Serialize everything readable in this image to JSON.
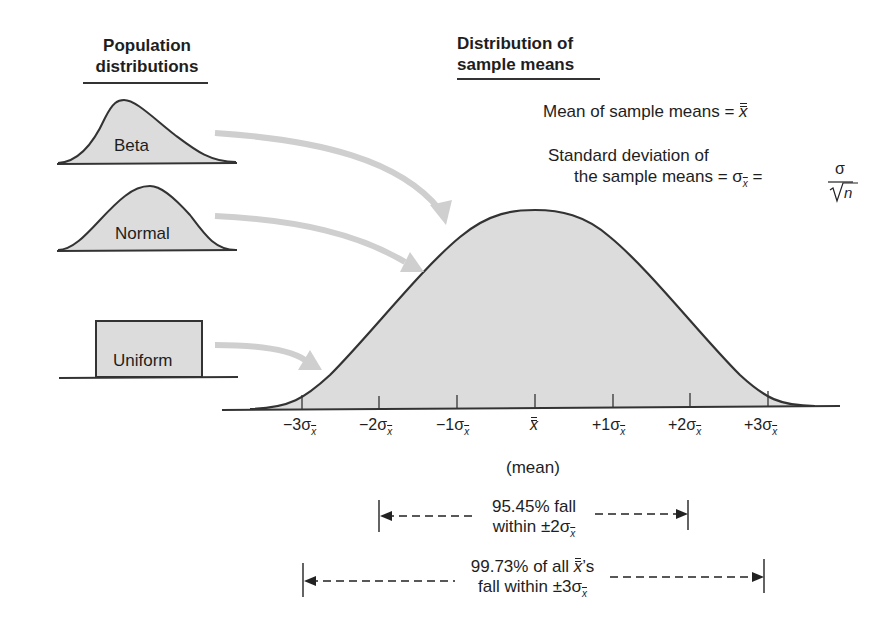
{
  "headings": {
    "population": [
      "Population",
      "distributions"
    ],
    "sample_means": [
      "Distribution of",
      "sample means"
    ]
  },
  "population_distributions": [
    {
      "name": "beta",
      "label": "Beta"
    },
    {
      "name": "normal",
      "label": "Normal"
    },
    {
      "name": "uniform",
      "label": "Uniform"
    }
  ],
  "formulas": {
    "mean": {
      "text": "Mean of sample means = ",
      "symbol": "x"
    },
    "sd_line1": "Standard deviation of",
    "sd_line2": "the sample means = σ",
    "sd_sub": "x",
    "sd_eq": " = ",
    "frac_num": "σ",
    "frac_den": "n"
  },
  "axis": {
    "ticks": [
      {
        "sign": "−3σ",
        "sub": "x"
      },
      {
        "sign": "−2σ",
        "sub": "x"
      },
      {
        "sign": "−1σ",
        "sub": "x"
      },
      {
        "sign": "x",
        "sub": "",
        "is_mean": true
      },
      {
        "sign": "+1σ",
        "sub": "x"
      },
      {
        "sign": "+2σ",
        "sub": "x"
      },
      {
        "sign": "+3σ",
        "sub": "x"
      }
    ],
    "mean_label": "(mean)"
  },
  "ranges": {
    "two_sigma": {
      "line1": "95.45% fall",
      "line2_prefix": "within ±2σ",
      "sub": "x"
    },
    "three_sigma": {
      "line1_prefix": "99.73% of all ",
      "line1_sym": "x",
      "line1_suffix": "’s",
      "line2_prefix": "fall within ±3σ",
      "sub": "x"
    }
  },
  "colors": {
    "fill": "#dcdcdc",
    "stroke": "#333333",
    "arrow": "#cfcfcf"
  }
}
